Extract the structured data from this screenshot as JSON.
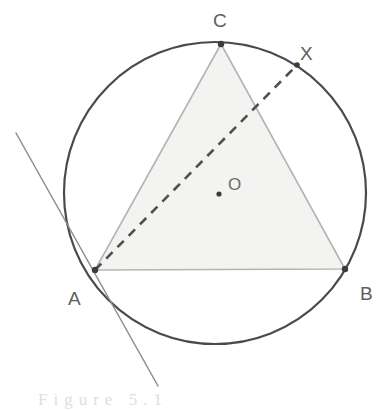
{
  "figure": {
    "caption": "Figure 5.1",
    "background_color": "#ffffff",
    "circle": {
      "name": "circumscribed-circle",
      "center_x": 215,
      "center_y": 193,
      "radius": 151,
      "stroke_color": "#4a4a4a",
      "stroke_width": 2.2,
      "fill": "none"
    },
    "triangle": {
      "name": "inscribed-triangle-abc",
      "fill_color": "#f3f3f2",
      "stroke_color": "#b4b4b2",
      "stroke_width": 1.6,
      "points": "95,270 345,269 221,44"
    },
    "chord": {
      "name": "chord-a-x",
      "x1": 95,
      "y1": 270,
      "x2": 297,
      "y2": 65,
      "stroke_color": "#4f4f4f",
      "stroke_width": 2.6,
      "dash_pattern": "9 7"
    },
    "tangent": {
      "name": "tangent-line-at-a",
      "x1": 16,
      "y1": 133,
      "x2": 158,
      "y2": 386,
      "stroke_color": "#8d8d8d",
      "stroke_width": 1.5
    },
    "points": [
      {
        "id": "A",
        "name": "point-a",
        "x": 95,
        "y": 270,
        "marker_r": 3.2,
        "marker_color": "#3c3c3c",
        "label": "A",
        "label_x": 68,
        "label_y": 305
      },
      {
        "id": "B",
        "name": "point-b",
        "x": 345,
        "y": 269,
        "marker_r": 3.2,
        "marker_color": "#3c3c3c",
        "label": "B",
        "label_x": 360,
        "label_y": 300
      },
      {
        "id": "C",
        "name": "point-c",
        "x": 221,
        "y": 44,
        "marker_r": 3.2,
        "marker_color": "#3c3c3c",
        "label": "C",
        "label_x": 213,
        "label_y": 27
      },
      {
        "id": "X",
        "name": "point-x",
        "x": 297,
        "y": 65,
        "marker_r": 2.8,
        "marker_color": "#3c3c3c",
        "label": "X",
        "label_x": 300,
        "label_y": 60
      },
      {
        "id": "O",
        "name": "point-o-center",
        "x": 219,
        "y": 194,
        "marker_r": 2.6,
        "marker_color": "#3c3c3c",
        "label": "O",
        "label_x": 228,
        "label_y": 190
      }
    ]
  },
  "chart_data": {
    "type": "diagram",
    "elements": [
      {
        "kind": "circle",
        "label": "circumcircle centre O",
        "center": [
          215,
          193
        ],
        "radius": 151
      },
      {
        "kind": "triangle",
        "label": "triangle ABC",
        "vertices": [
          [
            95,
            270
          ],
          [
            345,
            269
          ],
          [
            221,
            44
          ]
        ]
      },
      {
        "kind": "dashed-chord",
        "label": "AX",
        "from": [
          95,
          270
        ],
        "to": [
          297,
          65
        ]
      },
      {
        "kind": "line",
        "label": "tangent at A",
        "from": [
          16,
          133
        ],
        "to": [
          158,
          386
        ]
      },
      {
        "kind": "point",
        "label": "A",
        "at": [
          95,
          270
        ]
      },
      {
        "kind": "point",
        "label": "B",
        "at": [
          345,
          269
        ]
      },
      {
        "kind": "point",
        "label": "C",
        "at": [
          221,
          44
        ]
      },
      {
        "kind": "point",
        "label": "X",
        "at": [
          297,
          65
        ]
      },
      {
        "kind": "point",
        "label": "O",
        "at": [
          219,
          194
        ]
      }
    ],
    "labels": [
      "A",
      "B",
      "C",
      "X",
      "O"
    ]
  }
}
